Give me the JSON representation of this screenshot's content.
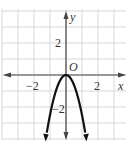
{
  "chart_data": {
    "type": "line",
    "title": "",
    "xlabel": "x",
    "ylabel": "y",
    "origin_label": "O",
    "xlim": [
      -4,
      4
    ],
    "ylim": [
      -4,
      4
    ],
    "grid": true,
    "grid_step": 1,
    "x_tick_labels": [
      {
        "value": -2,
        "label": "−2"
      },
      {
        "value": 2,
        "label": "2"
      }
    ],
    "y_tick_labels": [
      {
        "value": 2,
        "label": "2"
      },
      {
        "value": -2,
        "label": "−2"
      }
    ],
    "series": [
      {
        "name": "parabola",
        "equation": "y = -2.5x^2",
        "x": [
          -1.25,
          -1,
          -0.75,
          -0.5,
          -0.25,
          0,
          0.25,
          0.5,
          0.75,
          1,
          1.25
        ],
        "y": [
          -3.9,
          -2.5,
          -1.4,
          -0.625,
          -0.156,
          0,
          -0.156,
          -0.625,
          -1.4,
          -2.5,
          -3.9
        ],
        "arrows_at_ends": true
      }
    ],
    "colors": {
      "grid": "#d8d8d8",
      "axis": "#444444",
      "curve": "#111111"
    }
  }
}
